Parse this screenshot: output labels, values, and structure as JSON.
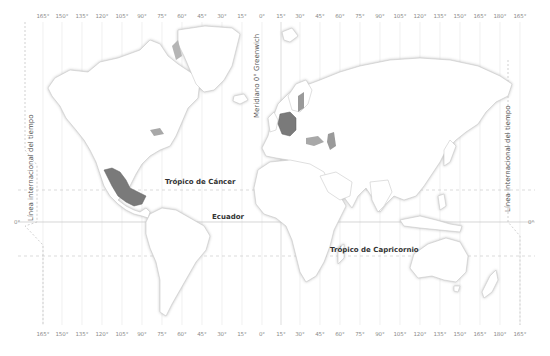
{
  "colors": {
    "background": "#ffffff",
    "land": "#ffffff",
    "coast_shadow": "#d6d6d6",
    "border": "#c8c8c8",
    "grid": "#e3e3e3",
    "highlight": "#7a7a7a",
    "lakes": "#9a9a9a",
    "label_text": "#333333"
  },
  "meridians_top": [
    "165°",
    "150°",
    "135°",
    "120°",
    "105°",
    "90°",
    "75°",
    "60°",
    "45°",
    "30°",
    "15°",
    "0°",
    "15°",
    "30°",
    "45°",
    "60°",
    "75°",
    "90°",
    "105°",
    "120°",
    "135°",
    "150°",
    "165°",
    "180°",
    "165°"
  ],
  "meridians_bottom": [
    "165°",
    "150°",
    "135°",
    "120°",
    "105°",
    "90°",
    "75°",
    "60°",
    "45°",
    "30°",
    "15°",
    "0°",
    "15°",
    "30°",
    "45°",
    "60°",
    "75°",
    "90°",
    "105°",
    "120°",
    "135°",
    "150°",
    "165°",
    "180°",
    "165°"
  ],
  "labels": {
    "greenwich": "Meridiano 0° Greenwich",
    "idl_left": "Línea internacional del tiempo",
    "idl_right": "Línea internacional del tiempo",
    "tropic_cancer": "Trópico de Cáncer",
    "equator": "Ecuador",
    "tropic_capricorn": "Trópico de Capricornio",
    "equator_left_deg": "0°",
    "equator_right_deg": "0°"
  },
  "highlighted_regions": [
    "Mexico",
    "Germany"
  ]
}
